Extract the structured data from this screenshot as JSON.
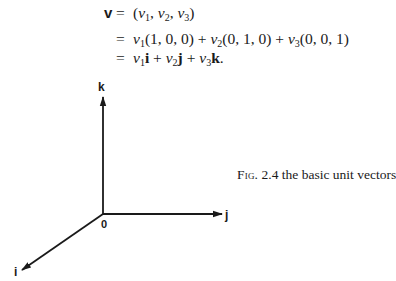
{
  "equation": {
    "lhs": "v",
    "equals": "=",
    "lines": [
      {
        "id": "line1",
        "show_lhs": true,
        "parts": [
          {
            "t": "(",
            "s": "n"
          },
          {
            "t": "v",
            "s": "i"
          },
          {
            "t": "1",
            "s": "sub"
          },
          {
            "t": ", ",
            "s": "n"
          },
          {
            "t": "v",
            "s": "i"
          },
          {
            "t": "2",
            "s": "sub"
          },
          {
            "t": ", ",
            "s": "n"
          },
          {
            "t": "v",
            "s": "i"
          },
          {
            "t": "3",
            "s": "sub"
          },
          {
            "t": ")",
            "s": "n"
          }
        ],
        "text": "(v1, v2, v3)"
      },
      {
        "id": "line2",
        "show_lhs": false,
        "parts": [
          {
            "t": "v",
            "s": "i"
          },
          {
            "t": "1",
            "s": "sub"
          },
          {
            "t": "(1, 0, 0) + ",
            "s": "n"
          },
          {
            "t": "v",
            "s": "i"
          },
          {
            "t": "2",
            "s": "sub"
          },
          {
            "t": "(0, 1, 0) + ",
            "s": "n"
          },
          {
            "t": "v",
            "s": "i"
          },
          {
            "t": "3",
            "s": "sub"
          },
          {
            "t": "(0, 0, 1)",
            "s": "n"
          }
        ],
        "text": "v1(1, 0, 0) + v2(0, 1, 0) + v3(0, 0, 1)"
      },
      {
        "id": "line3",
        "show_lhs": false,
        "parts": [
          {
            "t": "v",
            "s": "i"
          },
          {
            "t": "1",
            "s": "sub"
          },
          {
            "t": "i",
            "s": "b"
          },
          {
            "t": " + ",
            "s": "n"
          },
          {
            "t": "v",
            "s": "i"
          },
          {
            "t": "2",
            "s": "sub"
          },
          {
            "t": "j",
            "s": "b"
          },
          {
            "t": " + ",
            "s": "n"
          },
          {
            "t": "v",
            "s": "i"
          },
          {
            "t": "3",
            "s": "sub"
          },
          {
            "t": "k",
            "s": "b"
          },
          {
            "t": ".",
            "s": "n"
          }
        ],
        "text": "v1i + v2j + v3k."
      }
    ]
  },
  "figure": {
    "axes": {
      "origin_label": "0",
      "x_axis_label": "i",
      "y_axis_label": "j",
      "z_axis_label": "k"
    },
    "caption": {
      "fig_label": "Fig.",
      "number": "2.4",
      "text": "the basic unit vectors"
    },
    "stroke_color": "#1a1a1a"
  }
}
